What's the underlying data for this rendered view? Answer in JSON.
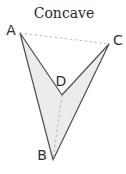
{
  "title": "Concave",
  "colors": {
    "background": "#ffffff",
    "polygon_fill": "#ececec",
    "polygon_edge": "#4f4f4f",
    "dashed_line": "#b8b8b8",
    "text": "#2a2a2a"
  },
  "diagram": {
    "type": "concave-quadrilateral",
    "vertices": [
      {
        "label": "A",
        "x": 20,
        "y": 33,
        "label_x": 11,
        "label_y": 35
      },
      {
        "label": "B",
        "x": 53,
        "y": 160,
        "label_x": 42,
        "label_y": 160
      },
      {
        "label": "C",
        "x": 109,
        "y": 44,
        "label_x": 118,
        "label_y": 45
      },
      {
        "label": "D",
        "x": 62,
        "y": 95,
        "label_x": 61,
        "label_y": 86
      }
    ],
    "polygon_order": [
      "A",
      "D",
      "C",
      "B"
    ],
    "solid_edges": [
      [
        "A",
        "D"
      ],
      [
        "D",
        "C"
      ],
      [
        "C",
        "B"
      ],
      [
        "B",
        "A"
      ]
    ],
    "dashed_edges": [
      [
        "A",
        "C"
      ],
      [
        "D",
        "B"
      ]
    ],
    "title_x": 64,
    "title_y": 18
  }
}
